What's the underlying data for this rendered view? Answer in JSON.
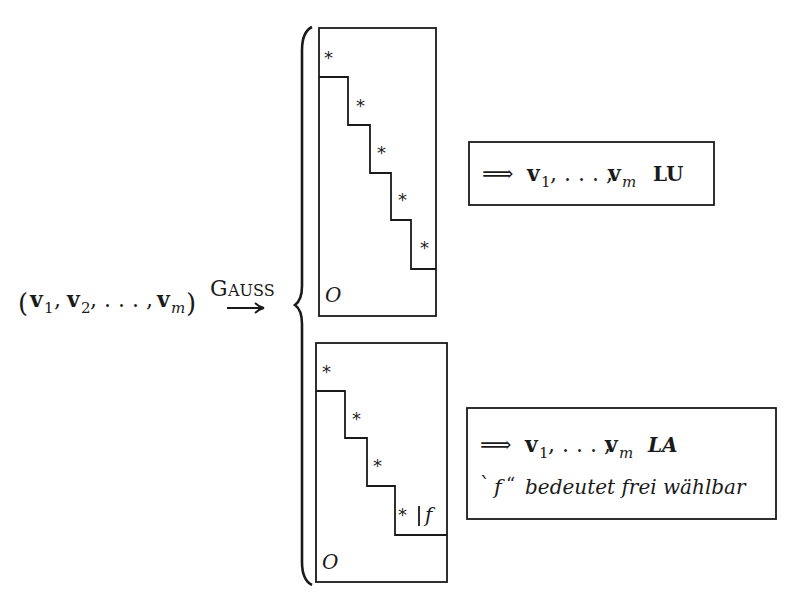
{
  "input": {
    "open_paren": "(",
    "v1": "v",
    "v1_sub": "1",
    "sep1": ",",
    "v2": "v",
    "v2_sub": "2",
    "sep2": ", . . . ,",
    "vm": "v",
    "vm_sub": "m",
    "close_paren": ")"
  },
  "arrow": {
    "label": "Gauss",
    "label_G": "G",
    "label_rest": "AUSS",
    "glyph": "⟶"
  },
  "cases": [
    {
      "id": "full-rank",
      "star_label": "*",
      "zero_label": "O",
      "staircase_steps": 5,
      "result": {
        "arrow": "⟹",
        "vectors_v": "v",
        "v1_sub": "1",
        "dots": ", . . . ,",
        "vm_sub": "m",
        "conclusion": "LU"
      }
    },
    {
      "id": "rank-deficient",
      "star_label": "*",
      "free_label": "f",
      "divider": "|",
      "zero_label": "O",
      "staircase_steps": 4,
      "result": {
        "arrow": "⟹",
        "vectors_v": "v",
        "v1_sub": "1",
        "dots": ", . . . ,",
        "vm_sub": "m",
        "conclusion": "LA",
        "note_open_quote": "`",
        "note_symbol": "f",
        "note_close_quote": "“",
        "note_text": "bedeutet frei wählbar"
      }
    }
  ]
}
